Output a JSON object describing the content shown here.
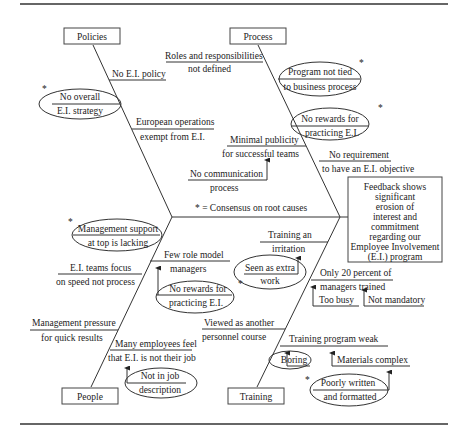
{
  "diagram": {
    "type": "fishbone",
    "effect": [
      "Feedback shows",
      "significant",
      "erosion of",
      "interest and",
      "commitment",
      "regarding our",
      "Employee Involvement",
      "(E.I.) program"
    ],
    "legend": "* = Consensus on root causes",
    "categories": {
      "policies": {
        "label": "Policies",
        "causes": [
          {
            "lines": [
              "No E.I. policy"
            ]
          },
          {
            "lines": [
              "No overall",
              "E.I. strategy"
            ],
            "root": true
          },
          {
            "lines": [
              "European operations",
              "exempt from E.I."
            ]
          }
        ]
      },
      "process": {
        "label": "Process",
        "causes": [
          {
            "lines": [
              "Roles and responsibilities",
              "not defined"
            ]
          },
          {
            "lines": [
              "Program not tied",
              "to business process"
            ],
            "root": true
          },
          {
            "lines": [
              "No rewards for",
              "practicing E.I."
            ],
            "root": true
          },
          {
            "lines": [
              "Minimal publicity",
              "for successful teams"
            ],
            "sub": {
              "lines": [
                "No communication",
                "process"
              ]
            }
          },
          {
            "lines": [
              "No requirement",
              "to have an E.I. objective"
            ]
          }
        ]
      },
      "people": {
        "label": "People",
        "causes": [
          {
            "lines": [
              "Management support",
              "at top is lacking"
            ],
            "root": true
          },
          {
            "lines": [
              "Few role model",
              "managers"
            ],
            "sub": {
              "lines": [
                "No rewards for",
                "practicing E.I."
              ],
              "root": true
            }
          },
          {
            "lines": [
              "E.I. teams focus",
              "on speed not process"
            ]
          },
          {
            "lines": [
              "Management pressure",
              "for quick results"
            ]
          },
          {
            "lines": [
              "Many employees feel",
              "that E.I. is not their job"
            ],
            "sub": {
              "lines": [
                "Not in job",
                "description"
              ]
            }
          }
        ]
      },
      "training": {
        "label": "Training",
        "causes": [
          {
            "lines": [
              "Training an",
              "irritation"
            ],
            "sub": {
              "lines": [
                "Seen as extra",
                "work"
              ]
            }
          },
          {
            "lines": [
              "Only 20 percent of",
              "managers trained"
            ],
            "subs": [
              {
                "lines": [
                  "Too busy"
                ]
              },
              {
                "lines": [
                  "Not mandatory"
                ]
              }
            ]
          },
          {
            "lines": [
              "Viewed as another",
              "personnel course"
            ]
          },
          {
            "lines": [
              "Training program weak"
            ],
            "subs": [
              {
                "lines": [
                  "Boring"
                ]
              },
              {
                "lines": [
                  "Materials complex"
                ],
                "sub": {
                  "lines": [
                    "Poorly written",
                    "and formatted"
                  ],
                  "root": true
                }
              }
            ]
          }
        ]
      }
    },
    "root_marker": "*"
  }
}
